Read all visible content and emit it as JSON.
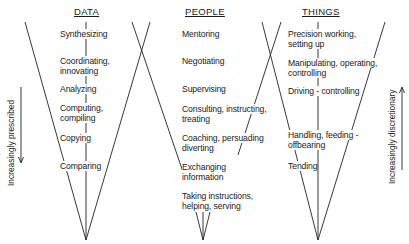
{
  "columns": [
    {
      "header": "DATA",
      "items": [
        "Synthesizing",
        "Coordinating,",
        "innovating",
        "Analyzing",
        "Computing,",
        "compiling",
        "Copying",
        "Comparing"
      ]
    },
    {
      "header": "PEOPLE",
      "items": [
        "Mentoring",
        "Negotiating",
        "Supervising",
        "Consulting, instructing,",
        "treating",
        "Coaching, persuading",
        "diverting",
        "Exchanging",
        "information",
        "Taking instructions,",
        "helping, serving"
      ]
    },
    {
      "header": "THINGS",
      "items": [
        "Precision working,",
        "setting up",
        "Manipulating, operating,",
        "controlling",
        "Driving - controlling",
        "Handling, feeding -",
        "offbearing",
        "Tending"
      ]
    }
  ],
  "axes": {
    "left": "Increasingly prescribed",
    "right": "Increasingly discretionary"
  }
}
